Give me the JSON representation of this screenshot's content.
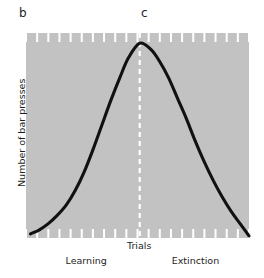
{
  "figure": {
    "panel_labels": {
      "left": "b",
      "right": "c"
    }
  },
  "chart_data": {
    "type": "line",
    "title": "",
    "subtitle": "",
    "xlabel": "Trials",
    "ylabel": "Number of bar presses",
    "grid": false,
    "legend": null,
    "plot_background_color": "#c2c2c2",
    "curve_color": "#111111",
    "tick_color": "#ffffff",
    "marker_line_color": "#ffffff",
    "marker_line_style": "dashed",
    "xlim": [
      0,
      100
    ],
    "ylim": [
      0,
      100
    ],
    "axis_tick_count_top": 20,
    "axis_tick_count_bottom": 20,
    "annotations": [
      {
        "name": "phase-learning",
        "text": "Learning",
        "x": 27
      },
      {
        "name": "phase-extinction",
        "text": "Extinction",
        "x": 76
      },
      {
        "name": "peak-marker",
        "text": "",
        "x": 51
      }
    ],
    "series": [
      {
        "name": "bar presses",
        "x": [
          2,
          6,
          10,
          14,
          18,
          22,
          26,
          30,
          34,
          38,
          42,
          46,
          51,
          56,
          60,
          64,
          68,
          72,
          76,
          80,
          84,
          88,
          92,
          96,
          100
        ],
        "values": [
          2,
          4,
          7,
          11,
          16,
          23,
          32,
          43,
          55,
          67,
          78,
          88,
          95,
          92,
          86,
          78,
          68,
          58,
          47,
          37,
          28,
          20,
          13,
          7,
          1
        ]
      }
    ]
  },
  "labels": {
    "y_axis": "Number of bar presses",
    "x_axis": "Trials",
    "learning": "Learning",
    "extinction": "Extinction"
  }
}
